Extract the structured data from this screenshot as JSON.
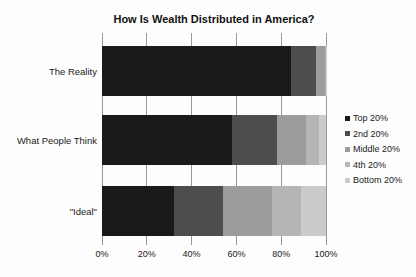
{
  "title": "How Is Wealth Distributed in America?",
  "chart_data": {
    "type": "bar",
    "orientation": "horizontal",
    "stacked": true,
    "title": "How Is Wealth Distributed in America?",
    "categories": [
      "The Reality",
      "What People Think",
      "\"Ideal\""
    ],
    "series": [
      {
        "name": "Top 20%",
        "color": "#1a1a1a",
        "values": [
          84,
          58,
          32
        ]
      },
      {
        "name": "2nd 20%",
        "color": "#4d4d4d",
        "values": [
          11,
          20,
          22
        ]
      },
      {
        "name": "Middle 20%",
        "color": "#9c9c9c",
        "values": [
          4,
          13,
          22
        ]
      },
      {
        "name": "4th 20%",
        "color": "#b5b5b5",
        "values": [
          0.2,
          6,
          13
        ]
      },
      {
        "name": "Bottom 20%",
        "color": "#cbcbcb",
        "values": [
          0.1,
          3,
          11
        ]
      }
    ],
    "x_ticks": [
      "0%",
      "20%",
      "40%",
      "60%",
      "80%",
      "100%"
    ],
    "xlim": [
      0,
      100
    ],
    "grid": "vertical-gridlines",
    "gridline_color": "#999999",
    "legend_position": "right",
    "background_color": "#fdfdfd"
  }
}
